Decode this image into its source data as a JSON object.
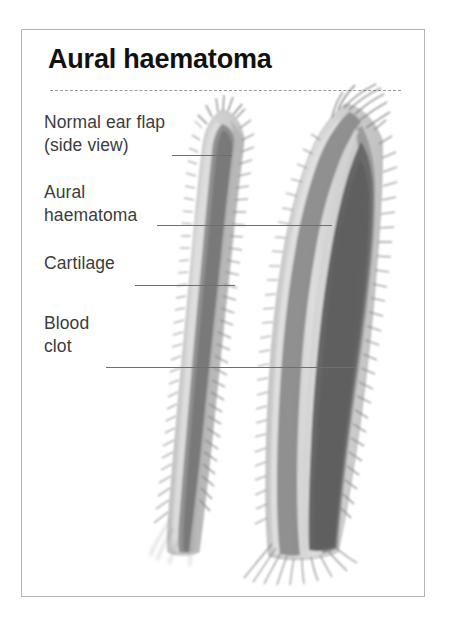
{
  "figure": {
    "title": "Aural haematoma",
    "border_color": "#b4b4b4",
    "background": "#ffffff",
    "rule_color": "#9a9a9a"
  },
  "labels": [
    {
      "id": "normal-ear-flap",
      "text": "Normal ear flap\n(side view)",
      "x": 44,
      "y": 111,
      "leader": {
        "x": 172,
        "y": 155,
        "width": 60
      }
    },
    {
      "id": "aural-haematoma",
      "text": "Aural\nhaematoma",
      "x": 44,
      "y": 181,
      "leader": {
        "x": 157,
        "y": 225,
        "width": 175
      }
    },
    {
      "id": "cartilage",
      "text": "Cartilage",
      "x": 44,
      "y": 252,
      "leader": {
        "x": 135,
        "y": 285,
        "width": 100
      }
    },
    {
      "id": "blood-clot",
      "text": "Blood\nclot",
      "x": 44,
      "y": 312,
      "leader": {
        "x": 106,
        "y": 367,
        "width": 250
      }
    }
  ],
  "illustration": {
    "description": "Two canine ear flaps shown in side view: a normal ear flap on the left and a swollen aural haematoma on the right.",
    "colors": {
      "skin": "#cfcfcf",
      "skin_light": "#dcdcdc",
      "cartilage": "#8a8a8a",
      "clot": "#6a6a6a",
      "clot_dark": "#5c5c5c",
      "hair": "#7e7e7e",
      "outline": "#9c9c9c"
    },
    "parts": [
      {
        "name": "normal-ear-skin",
        "tone": "#cfcfcf"
      },
      {
        "name": "normal-ear-cartilage",
        "tone": "#8a8a8a"
      },
      {
        "name": "haematoma-ear-skin",
        "tone": "#cfcfcf"
      },
      {
        "name": "haematoma-ear-cartilage",
        "tone": "#8a8a8a"
      },
      {
        "name": "blood-clot-mass",
        "tone": "#6a6a6a"
      }
    ]
  }
}
